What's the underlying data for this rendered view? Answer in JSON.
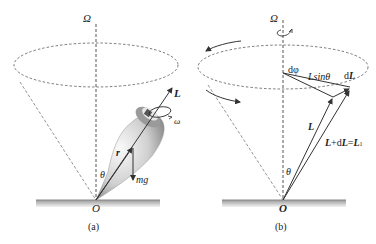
{
  "figure": {
    "panels": [
      {
        "id": "a",
        "caption": "(a)",
        "labels": {
          "axis": "Ω",
          "angular_momentum": "L",
          "spin": "ω",
          "position": "r",
          "angle": "θ",
          "weight": "mg",
          "origin": "O"
        }
      },
      {
        "id": "b",
        "caption": "(b)",
        "labels": {
          "axis": "Ω",
          "dphi": "dφ",
          "radius": "Lsinθ",
          "dL": "dL",
          "L": "L",
          "sum_lhs": "L",
          "sum_plus": "+d",
          "sum_L": "L",
          "sum_eq": "=",
          "sum_rhs": "L",
          "angle": "θ",
          "origin": "O"
        }
      }
    ],
    "colors": {
      "line": "#333333",
      "dashed": "#555555",
      "ground": "#b8b8b8",
      "top_body": "#d9d9d9"
    }
  }
}
